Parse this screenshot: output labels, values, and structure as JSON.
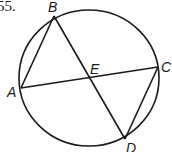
{
  "problem": {
    "number": "55."
  },
  "diagram": {
    "type": "circle with two intersecting chords",
    "circle": {
      "cx": 89,
      "cy": 78,
      "rx": 70,
      "ry": 68
    },
    "points": {
      "A": {
        "label": "A",
        "x": 21,
        "y": 88
      },
      "B": {
        "label": "B",
        "x": 54,
        "y": 16
      },
      "C": {
        "label": "C",
        "x": 158,
        "y": 67
      },
      "D": {
        "label": "D",
        "x": 125,
        "y": 139
      },
      "E": {
        "label": "E",
        "x": 89,
        "y": 77
      }
    },
    "segments": [
      "AB",
      "AC",
      "BD",
      "CD"
    ],
    "stroke_color": "#1a1a1a"
  }
}
